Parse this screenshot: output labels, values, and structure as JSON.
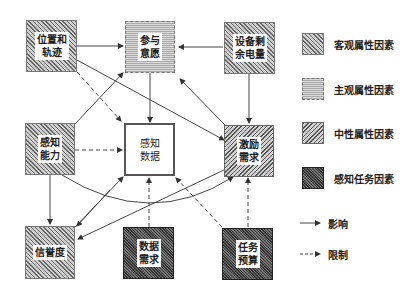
{
  "nodes": {
    "position": {
      "label_line1": "位置和",
      "label_line2": "轨迹",
      "category": "objective"
    },
    "willingness": {
      "label_line1": "参与",
      "label_line2": "意愿",
      "category": "subjective"
    },
    "battery": {
      "label_line1": "设备剩",
      "label_line2": "余电量",
      "category": "objective"
    },
    "capability": {
      "label_line1": "感知",
      "label_line2": "能力",
      "category": "objective"
    },
    "sensing_data": {
      "label_line1": "感知",
      "label_line2": "数据",
      "category": "data"
    },
    "incentive": {
      "label_line1": "激励",
      "label_line2": "需求",
      "category": "neutral"
    },
    "reputation": {
      "label_line1": "信誉度",
      "label_line2": "",
      "category": "objective"
    },
    "data_demand": {
      "label_line1": "数据",
      "label_line2": "需求",
      "category": "task"
    },
    "budget": {
      "label_line1": "任务",
      "label_line2": "预算",
      "category": "task"
    }
  },
  "legend": {
    "objective": "客观属性因素",
    "subjective": "主观属性因素",
    "neutral": "中性属性因素",
    "task": "感知任务因素",
    "influence": "影响",
    "constraint": "限制"
  },
  "edges": [
    {
      "from": "position",
      "to": "willingness",
      "type": "influence"
    },
    {
      "from": "position",
      "to": "incentive",
      "type": "influence"
    },
    {
      "from": "position",
      "to": "sensing_data",
      "type": "constraint"
    },
    {
      "from": "battery",
      "to": "willingness",
      "type": "influence"
    },
    {
      "from": "battery",
      "to": "incentive",
      "type": "influence"
    },
    {
      "from": "willingness",
      "to": "sensing_data",
      "type": "influence"
    },
    {
      "from": "incentive",
      "to": "willingness",
      "type": "influence"
    },
    {
      "from": "capability",
      "to": "willingness",
      "type": "influence"
    },
    {
      "from": "capability",
      "to": "sensing_data",
      "type": "constraint"
    },
    {
      "from": "capability",
      "to": "reputation",
      "type": "influence"
    },
    {
      "from": "capability",
      "to": "incentive",
      "type": "influence"
    },
    {
      "from": "incentive",
      "to": "reputation",
      "type": "influence"
    },
    {
      "from": "reputation",
      "to": "sensing_data",
      "type": "influence"
    },
    {
      "from": "data_demand",
      "to": "sensing_data",
      "type": "constraint"
    },
    {
      "from": "budget",
      "to": "sensing_data",
      "type": "constraint"
    },
    {
      "from": "budget",
      "to": "incentive",
      "type": "constraint"
    }
  ]
}
